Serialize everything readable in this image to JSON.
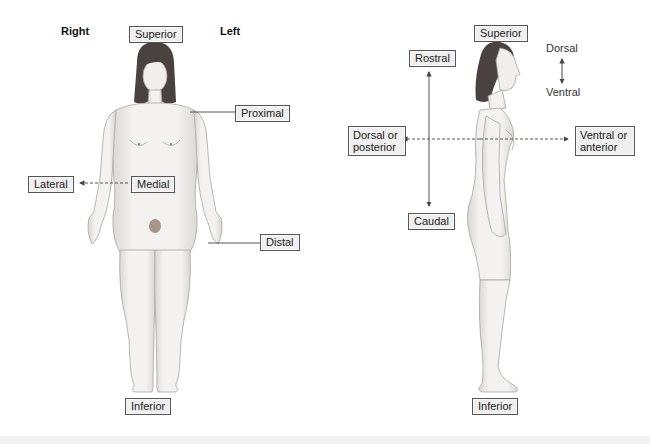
{
  "figure": {
    "anterior_view": {
      "side_labels": {
        "right": "Right",
        "left": "Left"
      },
      "labels": {
        "superior": "Superior",
        "proximal": "Proximal",
        "lateral": "Lateral",
        "medial": "Medial",
        "distal": "Distal",
        "inferior": "Inferior"
      }
    },
    "lateral_view": {
      "labels": {
        "superior": "Superior",
        "rostral": "Rostral",
        "caudal": "Caudal",
        "dorsal_posterior": "Dorsal or posterior",
        "ventral_anterior": "Ventral or anterior",
        "inferior": "Inferior"
      },
      "axis_key": {
        "top": "Dorsal",
        "bottom": "Ventral"
      }
    }
  },
  "colors": {
    "label_fill": "#efefef",
    "label_border": "#555555",
    "skin": "#f2f0ee",
    "skin_shade": "#c9c6c2",
    "hair": "#4a4240",
    "arrow": "#444444"
  }
}
